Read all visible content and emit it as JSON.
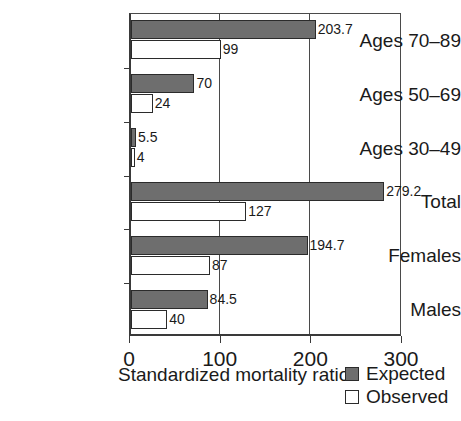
{
  "chart_data": {
    "type": "bar",
    "orientation": "horizontal",
    "title": "",
    "xlabel": "Standardized mortality ratio",
    "ylabel": "",
    "xlim": [
      0,
      300
    ],
    "xticks": [
      0,
      100,
      200,
      300
    ],
    "xticklabels": [
      "0",
      "100",
      "200",
      "300"
    ],
    "grid": "vertical-at-xticks",
    "legend_position": "bottom-right",
    "categories": [
      "Ages 70–89",
      "Ages 50–69",
      "Ages 30–49",
      "Total",
      "Females",
      "Males"
    ],
    "series": [
      {
        "name": "Expected",
        "color": "#6e6e6e",
        "values": [
          203.7,
          70,
          5.5,
          279.2,
          194.7,
          84.5
        ],
        "labels": [
          "203.7",
          "70",
          "5.5",
          "279.2",
          "194.7",
          "84.5"
        ]
      },
      {
        "name": "Observed",
        "color": "#ffffff",
        "values": [
          99,
          24,
          4,
          127,
          87,
          40
        ],
        "labels": [
          "99",
          "24",
          "4",
          "127",
          "87",
          "40"
        ]
      }
    ]
  },
  "axis": {
    "x_title": "Standardized mortality ratio",
    "tick_labels": [
      "0",
      "100",
      "200",
      "300"
    ]
  },
  "categories": [
    {
      "label": "Ages 70–89"
    },
    {
      "label": "Ages 50–69"
    },
    {
      "label": "Ages 30–49"
    },
    {
      "label": "Total"
    },
    {
      "label": "Females"
    },
    {
      "label": "Males"
    }
  ],
  "legend": [
    {
      "label": "Expected",
      "swatch": "expected"
    },
    {
      "label": "Observed",
      "swatch": "observed"
    }
  ],
  "colors": {
    "expected_fill": "#6e6e6e",
    "observed_fill": "#ffffff",
    "outline": "#2b2b2b",
    "axis": "#3a3a3a",
    "text": "#1a1a1a",
    "background": "#ffffff"
  }
}
